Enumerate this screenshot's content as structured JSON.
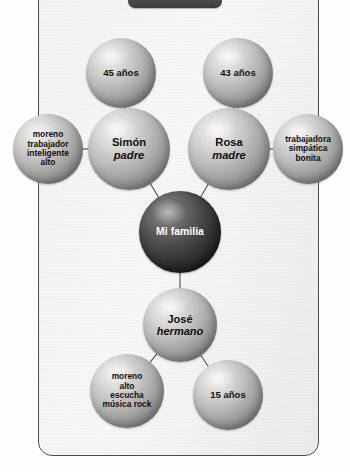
{
  "diagram": {
    "title_tab": "",
    "nodes": [
      {
        "id": "age-father",
        "line1": "45 años",
        "line2": "",
        "style": "light",
        "cx": 121,
        "cy": 73,
        "r": 35,
        "font": 9.5
      },
      {
        "id": "age-mother",
        "line1": "43 años",
        "line2": "",
        "style": "light",
        "cx": 238,
        "cy": 73,
        "r": 35,
        "font": 9.5
      },
      {
        "id": "traits-father",
        "line1": "moreno\ntrabajador\ninteligente\nalto",
        "line2": "",
        "style": "light",
        "cx": 48,
        "cy": 149,
        "r": 35,
        "font": 8.4
      },
      {
        "id": "father",
        "line1": "Simón",
        "line2": "padre",
        "style": "light",
        "cx": 129,
        "cy": 149,
        "r": 41,
        "font": 11.2
      },
      {
        "id": "mother",
        "line1": "Rosa",
        "line2": "madre",
        "style": "light",
        "cx": 229,
        "cy": 149,
        "r": 41,
        "font": 11.2
      },
      {
        "id": "traits-mother",
        "line1": "trabajadora\nsimpática\nbonita",
        "line2": "",
        "style": "light",
        "cx": 308,
        "cy": 149,
        "r": 35,
        "font": 8.4
      },
      {
        "id": "family",
        "line1": "Mi familia",
        "line2": "",
        "style": "dark",
        "cx": 180,
        "cy": 232,
        "r": 41,
        "font": 10.5
      },
      {
        "id": "brother",
        "line1": "José",
        "line2": "hermano",
        "style": "light",
        "cx": 180,
        "cy": 325,
        "r": 37,
        "font": 11.0
      },
      {
        "id": "traits-brother",
        "line1": "moreno\nalto\nescucha\nmúsica rock",
        "line2": "",
        "style": "light",
        "cx": 127,
        "cy": 391,
        "r": 37,
        "font": 8.4
      },
      {
        "id": "age-brother",
        "line1": "15 años",
        "line2": "",
        "style": "light",
        "cx": 228,
        "cy": 395,
        "r": 35,
        "font": 9.5
      }
    ],
    "edges": [
      {
        "from": "age-father",
        "to": "father"
      },
      {
        "from": "age-mother",
        "to": "mother"
      },
      {
        "from": "traits-father",
        "to": "father"
      },
      {
        "from": "traits-mother",
        "to": "mother"
      },
      {
        "from": "father",
        "to": "family"
      },
      {
        "from": "mother",
        "to": "family"
      },
      {
        "from": "family",
        "to": "brother"
      },
      {
        "from": "brother",
        "to": "traits-brother"
      },
      {
        "from": "brother",
        "to": "age-brother"
      }
    ],
    "colors": {
      "edge": "#4e4f52",
      "card_border": "#4a4a4c",
      "page_background": "#ffffff",
      "card_background": "#f2f2f1",
      "node_light": "#b8b8b7",
      "node_dark": "#333333",
      "tab": "#55565a"
    }
  }
}
